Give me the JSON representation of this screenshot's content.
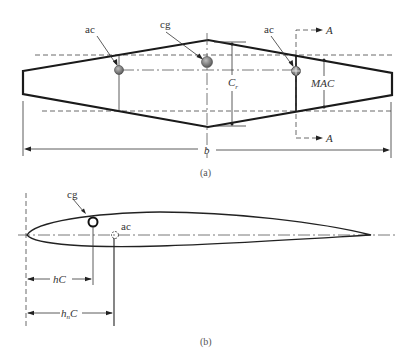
{
  "figure": {
    "part_a": {
      "caption": "(a)",
      "labels": {
        "ac_left": "ac",
        "cg": "cg",
        "ac_right": "ac",
        "section_top": "A",
        "section_bottom": "A",
        "root_chord_main": "C",
        "root_chord_sub": "r",
        "mac": "MAC",
        "span": "b"
      }
    },
    "part_b": {
      "caption": "(b)",
      "labels": {
        "cg": "cg",
        "ac": "ac",
        "hc": "hC",
        "hnc_main": "h",
        "hnc_sub": "n",
        "hnc_tail": "C"
      }
    },
    "colors": {
      "ink": "#1a1a1a",
      "cg_marker": "#7a7a7a",
      "background": "#ffffff"
    }
  }
}
